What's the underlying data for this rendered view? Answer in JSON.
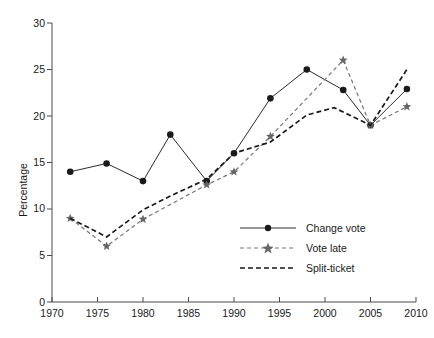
{
  "chart_data": {
    "type": "line",
    "title": "",
    "subtitle": "",
    "xlabel": "",
    "ylabel": "Percentage",
    "xlim": [
      1970,
      2010
    ],
    "ylim": [
      0,
      30
    ],
    "grid": false,
    "legend_position": "inside-lower-right",
    "x_ticks": [
      1970,
      1975,
      1980,
      1985,
      1990,
      1995,
      2000,
      2005,
      2010
    ],
    "y_ticks": [
      0,
      5,
      10,
      15,
      20,
      25,
      30
    ],
    "series": [
      {
        "name": "Change vote",
        "marker": "circle",
        "line_style": "solid",
        "color": "#2b2b2b",
        "x": [
          1972,
          1976,
          1980,
          1983,
          1987,
          1990,
          1994,
          1998,
          2002,
          2005,
          2009
        ],
        "values": [
          14.0,
          14.9,
          13.0,
          18.0,
          13.0,
          16.0,
          21.9,
          25.0,
          22.8,
          19.0,
          22.9
        ]
      },
      {
        "name": "Vote late",
        "marker": "star",
        "line_style": "dashed",
        "color": "#777777",
        "x": [
          1972,
          1976,
          1980,
          1987,
          1990,
          1994,
          2002,
          2005,
          2009
        ],
        "values": [
          9.0,
          6.0,
          8.9,
          12.6,
          14.0,
          17.8,
          26.0,
          19.0,
          21.0
        ]
      },
      {
        "name": "Split-ticket",
        "marker": "none",
        "line_style": "dashed",
        "color": "#1a1a1a",
        "x": [
          1972,
          1976,
          1980,
          1983,
          1987,
          1990,
          1994,
          1998,
          2001,
          2005,
          2009
        ],
        "values": [
          9.0,
          7.0,
          9.9,
          11.4,
          13.2,
          16.0,
          17.2,
          20.1,
          20.9,
          19.0,
          25.0
        ]
      }
    ]
  },
  "legend": {
    "items": [
      {
        "label": "Change vote"
      },
      {
        "label": "Vote late"
      },
      {
        "label": "Split-ticket"
      }
    ]
  },
  "axes": {
    "y_title": "Percentage",
    "y_tick_labels": [
      "30",
      "25",
      "20",
      "15",
      "10",
      "5",
      "0"
    ],
    "x_tick_labels": [
      "1970",
      "1975",
      "1980",
      "1985",
      "1990",
      "1995",
      "2000",
      "2005",
      "2010"
    ]
  }
}
